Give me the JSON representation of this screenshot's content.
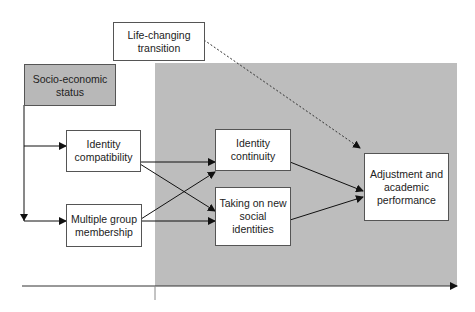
{
  "diagram": {
    "boxes": {
      "life_changing": "Life-changing transition",
      "ses": "Socio-economic status",
      "identity_compatibility": "Identity compatibility",
      "multiple_group": "Multiple group membership",
      "identity_continuity": "Identity continuity",
      "new_identities": "Taking on new social identities",
      "outcome": "Adjustment and academic performance"
    },
    "edges": [
      {
        "from": "ses",
        "to": "identity_compatibility"
      },
      {
        "from": "ses",
        "to": "multiple_group"
      },
      {
        "from": "identity_compatibility",
        "to": "identity_continuity"
      },
      {
        "from": "identity_compatibility",
        "to": "new_identities"
      },
      {
        "from": "multiple_group",
        "to": "identity_continuity"
      },
      {
        "from": "multiple_group",
        "to": "new_identities"
      },
      {
        "from": "identity_continuity",
        "to": "outcome"
      },
      {
        "from": "new_identities",
        "to": "outcome"
      },
      {
        "from": "life_changing",
        "to": "outcome",
        "style": "dashed"
      }
    ],
    "colors": {
      "shaded_region": "#bdbdbd",
      "ses_box": "#b8b8b8",
      "line": "#222222"
    }
  }
}
